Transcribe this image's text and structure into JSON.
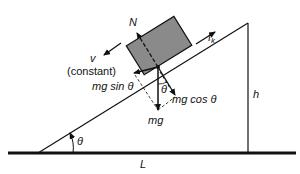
{
  "diagram": {
    "labels": {
      "normal_force": "N",
      "friction": "f",
      "friction_sub": "k",
      "velocity": "v",
      "velocity_note": "(constant)",
      "parallel_component": "mg sin θ",
      "perpendicular_component": "mg cos θ",
      "weight": "mg",
      "angle_block": "θ",
      "angle_base": "θ",
      "height": "h",
      "length": "L"
    },
    "colors": {
      "block_fill": "#8a8a8a",
      "line": "#111111"
    }
  }
}
